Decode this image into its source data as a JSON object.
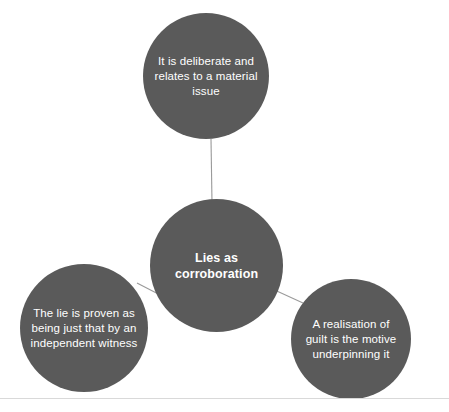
{
  "diagram": {
    "type": "hub-and-spoke",
    "center": {
      "id": "lies-as-corroboration",
      "label": "Lies as corroboration",
      "bold": true,
      "fill": "#5a5a5a",
      "text_color": "#ffffff"
    },
    "nodes": [
      {
        "id": "deliberate-material-issue",
        "position": "top",
        "label": "It is deliberate and relates to a material issue",
        "fill": "#5a5a5a",
        "text_color": "#ffffff"
      },
      {
        "id": "proven-independent-witness",
        "position": "bottom-left",
        "label": "The lie is proven as being just that by an independent witness",
        "fill": "#5a5a5a",
        "text_color": "#ffffff"
      },
      {
        "id": "realisation-of-guilt",
        "position": "bottom-right",
        "label": "A realisation of guilt is the motive underpinning it",
        "fill": "#5a5a5a",
        "text_color": "#ffffff"
      }
    ],
    "connectors": [
      {
        "id": "center-to-top",
        "from": "lies-as-corroboration",
        "to": "deliberate-material-issue",
        "color": "#9a9a9a"
      },
      {
        "id": "center-to-bottom-left",
        "from": "lies-as-corroboration",
        "to": "proven-independent-witness",
        "color": "#9a9a9a"
      },
      {
        "id": "center-to-bottom-right",
        "from": "lies-as-corroboration",
        "to": "realisation-of-guilt",
        "color": "#9a9a9a"
      }
    ],
    "footer_rule_color": "#d9d9d9",
    "background": "#ffffff"
  }
}
